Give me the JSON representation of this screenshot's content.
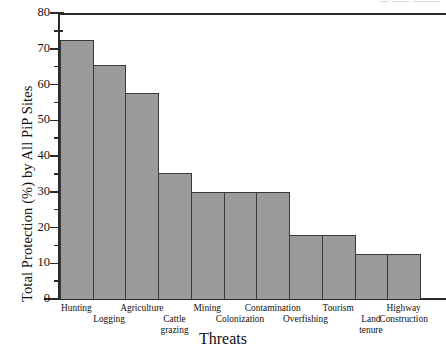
{
  "top_artifact": "— ——  ———",
  "chart_data": {
    "type": "bar",
    "title": "",
    "xlabel": "Threats",
    "ylabel": "Total Protection (%) by All PiP Sites",
    "categories": [
      "Hunting",
      "Logging",
      "Agriculture",
      "Cattle\ngrazing",
      "Mining",
      "Colonization",
      "Contamination",
      "Overfishing",
      "Tourism",
      "Land\ntenure",
      "Highway\nConstruction"
    ],
    "values": [
      72.5,
      65.5,
      57.5,
      35.3,
      30,
      30,
      30,
      18,
      18,
      12.5,
      12.5
    ],
    "ylim": [
      0,
      80
    ],
    "ytick_labels": [
      "80",
      "70",
      "60",
      "50",
      "40",
      "30",
      "20",
      "10",
      "0"
    ],
    "ytick_values": [
      80,
      70,
      60,
      50,
      40,
      30,
      20,
      10,
      0
    ],
    "yminor_values": [
      75,
      65,
      55,
      45,
      35,
      25,
      15,
      5
    ],
    "grid": false,
    "legend": false,
    "bar_color": "#9b9b9b",
    "bar_edge_color": "#3a3a3a",
    "axis_color": "#2b2b2b"
  }
}
